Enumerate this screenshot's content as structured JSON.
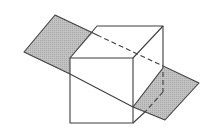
{
  "diagram": {
    "colors": {
      "background": "#ffffff",
      "line": "#3f3f3f",
      "plane_fill": "#b9b9b9"
    },
    "plane": {
      "vertices": [
        [
          55,
          15
        ],
        [
          199,
          83
        ],
        [
          165,
          120
        ],
        [
          24,
          52
        ]
      ]
    },
    "cube": {
      "front_face": [
        [
          70,
          58
        ],
        [
          133,
          58
        ],
        [
          133,
          123
        ],
        [
          70,
          123
        ]
      ],
      "top_face": [
        [
          70,
          58
        ],
        [
          97,
          26
        ],
        [
          163,
          26
        ],
        [
          133,
          58
        ]
      ],
      "side_face": [
        [
          133,
          58
        ],
        [
          163,
          26
        ],
        [
          163,
          91
        ],
        [
          133,
          123
        ]
      ]
    },
    "visible_plane_regions": {
      "left": [
        [
          55,
          15
        ],
        [
          93,
          33
        ],
        [
          70,
          58
        ],
        [
          70,
          74
        ],
        [
          24,
          52
        ]
      ],
      "right": [
        [
          163,
          67
        ],
        [
          199,
          83
        ],
        [
          165,
          120
        ],
        [
          133,
          107
        ]
      ]
    },
    "hidden_edges": [
      [
        [
          97,
          35
        ],
        [
          163,
          66
        ]
      ],
      [
        [
          163,
          70
        ],
        [
          163,
          92
        ]
      ],
      [
        [
          163,
          92
        ],
        [
          146,
          111
        ]
      ]
    ]
  }
}
